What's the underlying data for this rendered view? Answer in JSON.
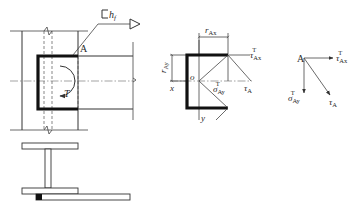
{
  "diagram": {
    "type": "structural steel connection - weld stress analysis",
    "left_view": {
      "weld_symbol_label": "h",
      "weld_symbol_subscript": "f",
      "point_label": "A",
      "torque_label": "T"
    },
    "middle_view": {
      "r_ax_label": "r",
      "r_ax_sub": "Ax",
      "r_ay_label": "r",
      "r_ay_sub": "Ay",
      "origin_label": "o",
      "x_axis_label": "x",
      "y_axis_label": "y",
      "tau_ax_label": "τ",
      "tau_ax_sub": "Ax",
      "tau_ax_sup": "T",
      "tau_a_label": "τ",
      "tau_a_sub": "A",
      "sigma_ay_label": "σ",
      "sigma_ay_sub": "Ay",
      "sigma_ay_sup": "T"
    },
    "right_view": {
      "point_label": "A",
      "tau_ax_label": "τ",
      "tau_ax_sub": "Ax",
      "tau_ax_sup": "T",
      "sigma_ay_label": "σ",
      "sigma_ay_sub": "Ay",
      "sigma_ay_sup": "T",
      "tau_a_label": "τ",
      "tau_a_sub": "A"
    },
    "colors": {
      "line": "#333333",
      "weld": "#111111",
      "background": "#ffffff"
    }
  }
}
